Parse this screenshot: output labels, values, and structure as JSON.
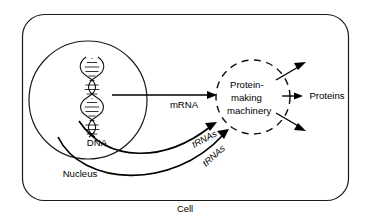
{
  "diagram": {
    "background_color": "#ffffff",
    "stroke_color": "#000000",
    "labels": {
      "cell": "Cell",
      "nucleus": "Nucleus",
      "dna": "DNA",
      "mrna": "mRNA",
      "trna_upper": "tRNAs",
      "trna_lower": "tRNAs",
      "proteins": "Proteins",
      "machinery_line1": "Protein-",
      "machinery_line2": "making",
      "machinery_line3": "machinery"
    },
    "structures": {
      "cell_shape": "rounded-rectangle",
      "nucleus_shape": "circle",
      "machinery_shape": "dashed-circle",
      "dna_shape": "double-helix"
    }
  }
}
